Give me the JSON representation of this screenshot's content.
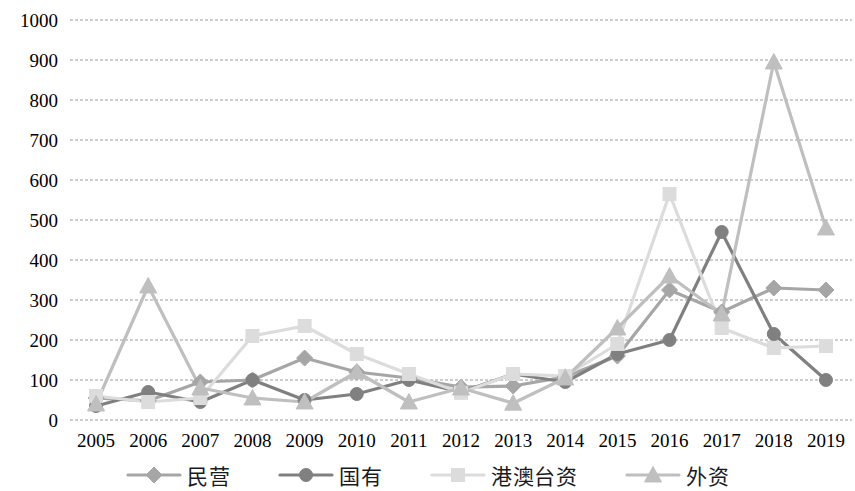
{
  "chart_data": {
    "type": "line",
    "title": "",
    "xlabel": "",
    "ylabel": "",
    "ylim": [
      0,
      1000
    ],
    "ytick_step": 100,
    "grid": true,
    "legend_position": "bottom",
    "categories": [
      "2005",
      "2006",
      "2007",
      "2008",
      "2009",
      "2010",
      "2011",
      "2012",
      "2013",
      "2014",
      "2015",
      "2016",
      "2017",
      "2018",
      "2019"
    ],
    "yticks": [
      "0",
      "100",
      "200",
      "300",
      "400",
      "500",
      "600",
      "700",
      "800",
      "900",
      "1000"
    ],
    "series": [
      {
        "name": "民营",
        "marker": "diamond",
        "color": "#a6a6a6",
        "values": [
          55,
          48,
          95,
          100,
          155,
          120,
          105,
          82,
          85,
          108,
          160,
          325,
          270,
          330,
          325
        ]
      },
      {
        "name": "国有",
        "marker": "circle",
        "color": "#808080",
        "values": [
          35,
          70,
          45,
          100,
          50,
          65,
          100,
          70,
          115,
          95,
          165,
          200,
          470,
          215,
          100
        ]
      },
      {
        "name": "港澳台资",
        "marker": "square",
        "color": "#dcdcdc",
        "values": [
          60,
          45,
          55,
          210,
          235,
          165,
          115,
          68,
          115,
          110,
          190,
          565,
          230,
          180,
          185
        ]
      },
      {
        "name": "外资",
        "marker": "triangle",
        "color": "#bfbfbf",
        "values": [
          40,
          335,
          80,
          55,
          45,
          120,
          45,
          80,
          42,
          105,
          230,
          360,
          265,
          895,
          480
        ]
      }
    ]
  },
  "legend": {
    "items": [
      {
        "label": "民营",
        "marker": "diamond-marker",
        "color": "#a6a6a6"
      },
      {
        "label": "国有",
        "marker": "circle-marker",
        "color": "#808080"
      },
      {
        "label": "港澳台资",
        "marker": "square-marker",
        "color": "#dcdcdc"
      },
      {
        "label": "外资",
        "marker": "triangle-marker",
        "color": "#bfbfbf"
      }
    ]
  },
  "axes": {
    "grid_color": "#9a9a9a"
  }
}
